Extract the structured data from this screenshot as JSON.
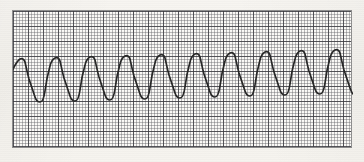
{
  "document": {
    "kind": "ecg-rhythm-strip",
    "title": "ECG Rhythm Strip",
    "paper_color": "#f6f4f0",
    "grid_fine_color": "#5f5f64",
    "grid_major_color": "#3a3a40",
    "trace_color": "#262626",
    "border_color": "#8e8e8e"
  },
  "grid": {
    "left": 12,
    "top": 10,
    "width": 340,
    "height": 138,
    "fine_cell_px": 3,
    "cells_per_major": 5,
    "major_cell_px": 15
  },
  "chart_data": {
    "type": "line",
    "title": "",
    "xlabel": "",
    "ylabel": "",
    "grid": true,
    "legend": null,
    "rhythm": "monomorphic wide-complex tachycardia",
    "cycle_count": 14,
    "cycle_period_px": 24,
    "peak_y_px": 49,
    "trough_y_px": 101,
    "baseline_y_px": 75,
    "xlim": [
      0,
      340
    ],
    "ylim": [
      138,
      0
    ],
    "series": [
      {
        "name": "ecg",
        "points": "M 0,58 C 2,54 4,50 7,48 C 9,47 11,48 12,51 C 13,55 14,61 16,68 C 18,74 20,80 22,86 C 23,89 25,91 27,91 C 29,91 31,87 32,80 C 33,72 35,62 37,55 C 38,51 40,48 42,47 C 44,46 46,47 47,50 C 48,54 49,60 51,67 C 53,73 55,79 57,85 C 58,88 60,90 62,90 C 64,90 66,86 67,79 C 68,71 70,61 72,54 C 73,50 75,47 77,46 C 79,45 81,46 82,49 C 83,53 84,59 86,66 C 88,72 90,78 92,84 C 93,87 95,89 97,89 C 99,89 101,85 102,78 C 103,70 105,60 107,53 C 108,49 110,46 112,45 C 114,44 116,45 117,48 C 118,52 119,58 121,65 C 123,71 125,77 127,83 C 128,86 130,88 132,88 C 134,88 136,84 137,77 C 138,69 140,59 142,52 C 143,48 145,45 147,44 C 149,43 151,44 152,47 C 153,51 154,57 156,64 C 158,70 160,76 162,82 C 163,85 165,87 167,87 C 169,87 171,83 172,76 C 173,68 175,58 177,51 C 178,47 180,44 182,43 C 184,42 186,43 187,46 C 188,50 189,56 191,63 C 193,69 195,75 197,81 C 198,84 200,86 202,86 C 204,86 206,82 207,75 C 208,67 210,57 212,50 C 213,46 215,43 217,42 C 219,41 221,42 222,45 C 223,49 224,55 226,62 C 228,68 230,74 232,80 C 233,83 235,85 237,85 C 239,85 241,81 242,74 C 243,66 245,56 247,49 C 248,45 250,42 252,41 C 254,40 256,41 257,44 C 258,48 259,54 261,61 C 263,67 265,73 267,79 C 268,82 270,84 272,84 C 274,84 276,80 277,73 C 278,65 280,55 282,48 C 283,44 285,41 287,40 C 289,39 291,40 292,43 C 293,47 294,53 296,60 C 298,66 300,72 302,78 C 303,81 305,83 307,83 C 309,83 311,79 312,72 C 313,64 315,54 317,47 C 318,43 320,40 322,39 C 324,38 326,39 327,42 C 328,46 329,52 331,59 C 333,65 335,71 337,77 C 338,80 339,82 340,83"
      }
    ]
  }
}
